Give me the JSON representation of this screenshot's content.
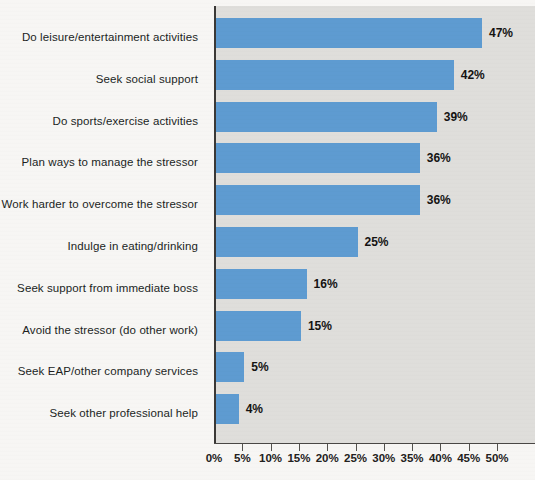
{
  "chart_data": {
    "type": "bar",
    "orientation": "horizontal",
    "title": "",
    "xlabel": "",
    "ylabel": "",
    "xlim": [
      0,
      50
    ],
    "grid": false,
    "legend": null,
    "categories": [
      "Do leisure/entertainment activities",
      "Seek social support",
      "Do sports/exercise activities",
      "Plan ways to manage the stressor",
      "Work harder to overcome the stressor",
      "Indulge in eating/drinking",
      "Seek support from immediate boss",
      "Avoid the stressor (do other work)",
      "Seek EAP/other company services",
      "Seek other professional help"
    ],
    "values": [
      47,
      42,
      39,
      36,
      36,
      25,
      16,
      15,
      5,
      4
    ],
    "value_labels": [
      "47%",
      "42%",
      "39%",
      "36%",
      "36%",
      "25%",
      "16%",
      "15%",
      "5%",
      "4%"
    ],
    "x_ticks": [
      0,
      5,
      10,
      15,
      20,
      25,
      30,
      35,
      40,
      45,
      50
    ],
    "x_tick_labels": [
      "0%",
      "5%",
      "10%",
      "15%",
      "20%",
      "25%",
      "30%",
      "35%",
      "40%",
      "45%",
      "50%"
    ],
    "colors": {
      "bar": "#5e9bd1",
      "plot_background": "#dfdedb",
      "page_background": "#f7f6f4",
      "axis": "#3a3836",
      "label_text": "#211f1e",
      "value_text": "#141312"
    }
  }
}
